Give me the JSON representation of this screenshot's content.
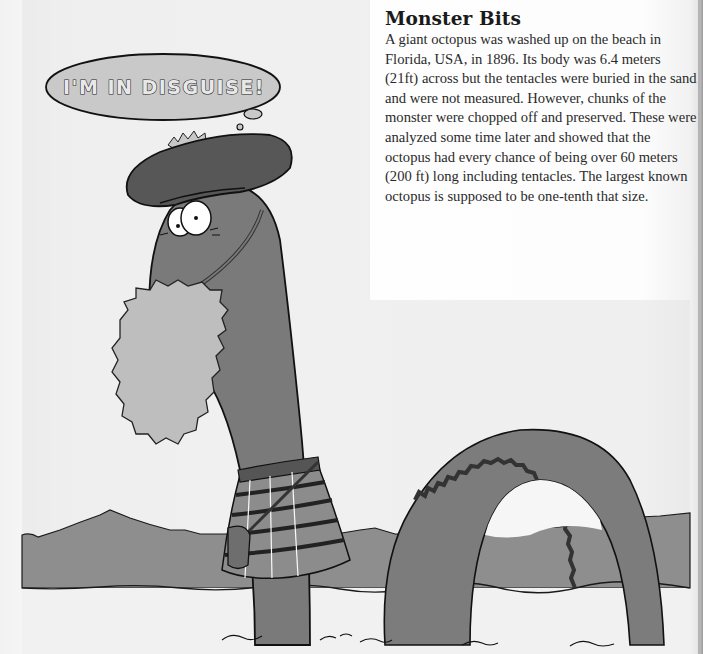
{
  "sidebar": {
    "title": "Monster Bits",
    "body": "A giant octopus was washed up on the beach in Florida, USA, in 1896. Its body was 6.4 meters (21ft) across but the tentacles were buried in the sand and were not measured. However, chunks of the monster were chopped off and preserved. These were analyzed some time later and showed that the octopus had every chance of being over 60 meters (200 ft) long including tentacles. The largest known octopus is supposed to be one-tenth that size."
  },
  "illustration": {
    "speech_bubble": "I'M IN DISGUISE!",
    "colors": {
      "sky": "#d9d9d9",
      "mountains": "#8c8c8c",
      "water": "#ededed",
      "monster": "#7a7a7a",
      "hat": "#555555",
      "beard": "#bdbdbd",
      "kilt": "#8a8a8a",
      "outline": "#111111"
    }
  }
}
